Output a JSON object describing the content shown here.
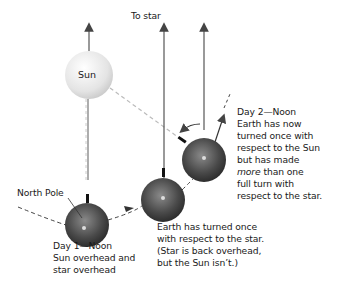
{
  "labels": {
    "to_star": "To star",
    "sun": "Sun",
    "north_pole": "North Pole",
    "day1": {
      "line1": "Day 1—Noon",
      "line2": "Sun overhead and",
      "line3": "star overhead"
    },
    "middle": {
      "line1": "Earth has turned once",
      "line2": "with respect to the star.",
      "line3": "(Star is back overhead,",
      "line4": "but the Sun isn’t.)"
    },
    "day2": {
      "line1": "Day 2—Noon",
      "line2": "Earth has now",
      "line3": "turned once with",
      "line4": "respect to the Sun",
      "line5": "but has made",
      "line6_em": "more",
      "line6_rest": " than one",
      "line7": "full turn with",
      "line8": "respect to the star."
    }
  },
  "colors": {
    "sun": "#e6e6e6",
    "earth": "#555555",
    "line": "#555555",
    "dashed": "#aaaaaa"
  }
}
